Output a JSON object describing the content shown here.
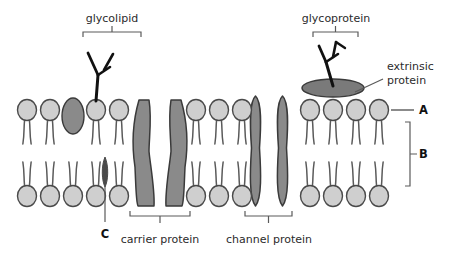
{
  "diagram": {
    "background_color": "#ffffff"
  },
  "labels": {
    "glycolipid": "glycolipid",
    "glycoprotein": "glycoprotein",
    "extrinsic_line1": "extrinsic",
    "extrinsic_line2": "protein",
    "carrier_protein": "carrier protein",
    "channel_protein": "channel protein",
    "marker_a": "A",
    "marker_b": "B",
    "marker_c": "C"
  },
  "colors": {
    "head_fill": "#cfcfcf",
    "head_stroke": "#4a4a4a",
    "tail_stroke": "#5a5a5a",
    "protein_fill": "#8a8a8a",
    "protein_stroke": "#3a3a3a",
    "extrinsic_fill": "#7a7a7a",
    "dark_inclusion": "#4a4a4a",
    "label_text": "#2b2b2b",
    "marker_text": "#111111",
    "leader_line": "#5a5a5a",
    "glyco_chain": "#111111"
  },
  "structures": {
    "upper_leaflet_heads": [
      {
        "cx": 27,
        "cy": 110
      },
      {
        "cx": 50,
        "cy": 110
      },
      {
        "cx": 96,
        "cy": 110
      },
      {
        "cx": 119,
        "cy": 110
      },
      {
        "cx": 196,
        "cy": 110
      },
      {
        "cx": 219,
        "cy": 110
      },
      {
        "cx": 242,
        "cy": 110
      },
      {
        "cx": 310,
        "cy": 110
      },
      {
        "cx": 333,
        "cy": 110
      },
      {
        "cx": 356,
        "cy": 110
      },
      {
        "cx": 379,
        "cy": 110
      }
    ],
    "lower_leaflet_heads": [
      {
        "cx": 27,
        "cy": 196
      },
      {
        "cx": 50,
        "cy": 196
      },
      {
        "cx": 73,
        "cy": 196
      },
      {
        "cx": 96,
        "cy": 196
      },
      {
        "cx": 119,
        "cy": 196
      },
      {
        "cx": 196,
        "cy": 196
      },
      {
        "cx": 219,
        "cy": 196
      },
      {
        "cx": 242,
        "cy": 196
      },
      {
        "cx": 310,
        "cy": 196
      },
      {
        "cx": 333,
        "cy": 196
      },
      {
        "cx": 356,
        "cy": 196
      },
      {
        "cx": 379,
        "cy": 196
      }
    ],
    "intrinsic_ellipse_upper": {
      "cx": 73,
      "cy": 116,
      "rx": 11,
      "ry": 18
    },
    "dark_inclusion_lower": {
      "cx": 105,
      "cy": 172,
      "rx": 4,
      "ry": 15
    },
    "extrinsic_protein": {
      "cx": 333,
      "cy": 88,
      "rx": 31,
      "ry": 9
    },
    "carrier_protein": {
      "x": 133,
      "y": 96,
      "width": 54,
      "height": 110
    },
    "channel_protein": {
      "x": 249,
      "y": 96,
      "width": 40,
      "height": 110
    }
  },
  "annotations": {
    "glycolipid_bracket": {
      "x1": 83,
      "x2": 141,
      "y": 32
    },
    "glycoprotein_bracket": {
      "x1": 313,
      "x2": 358,
      "y": 32
    },
    "carrier_bracket": {
      "x1": 130,
      "x2": 190,
      "y": 216
    },
    "channel_bracket": {
      "x1": 245,
      "x2": 292,
      "y": 216
    },
    "marker_a_leader": {
      "x1": 391,
      "x2": 414,
      "y": 110
    },
    "marker_b_bracket": {
      "x1": 410,
      "y1": 122,
      "y2": 186
    },
    "marker_c_leader": {
      "x1": 105,
      "y1": 186,
      "y2": 222
    },
    "extrinsic_leader": {
      "x1": 355,
      "y1": 92,
      "x2": 383,
      "y2": 79
    }
  }
}
